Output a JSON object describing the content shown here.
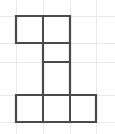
{
  "figure": {
    "type": "grid-polyomino",
    "background_color": "#ffffff",
    "grid": {
      "visible": true,
      "line_color": "#e9e9ea",
      "cell_size": 27,
      "origin_x": 16,
      "origin_y": 16,
      "vertical_lines_x": [
        16,
        43,
        70,
        96
      ],
      "horizontal_lines_y": [
        16,
        43,
        62,
        95,
        122
      ],
      "extra_vertical_lines_x": [],
      "columns": 3,
      "rows": 4
    },
    "shape": {
      "name": "hexomino",
      "cell_count": 6,
      "stroke_color": "#4a4a4a",
      "stroke_width": 2.2,
      "fill_color": "#ffffff",
      "cells": [
        {
          "label": "cell-r0c0",
          "row": 0,
          "col": 0,
          "x": 16,
          "y": 16,
          "w": 27,
          "h": 27
        },
        {
          "label": "cell-r0c1",
          "row": 0,
          "col": 1,
          "x": 43,
          "y": 16,
          "w": 27,
          "h": 27
        },
        {
          "label": "cell-r1c1",
          "row": 1,
          "col": 1,
          "x": 43,
          "y": 43,
          "w": 27,
          "h": 19
        },
        {
          "label": "cell-r2c1",
          "row": 2,
          "col": 1,
          "x": 43,
          "y": 62,
          "w": 27,
          "h": 33
        },
        {
          "label": "cell-r3c0",
          "row": 3,
          "col": 0,
          "x": 16,
          "y": 95,
          "w": 27,
          "h": 27
        },
        {
          "label": "cell-r3c1",
          "row": 3,
          "col": 1,
          "x": 43,
          "y": 95,
          "w": 27,
          "h": 27
        },
        {
          "label": "cell-r3c2",
          "row": 3,
          "col": 2,
          "x": 70,
          "y": 95,
          "w": 26,
          "h": 27
        }
      ],
      "outline_path": "M16,16 L70,16 L70,95 L96,95 L96,122 L16,122 L16,95 L43,95 L43,43 L16,43 Z",
      "internal_dividers": [
        {
          "label": "divider-top-vertical",
          "x1": 43,
          "y1": 16,
          "x2": 43,
          "y2": 43
        },
        {
          "label": "divider-row0-row1",
          "x1": 43,
          "y1": 43,
          "x2": 70,
          "y2": 43
        },
        {
          "label": "divider-row1-row2",
          "x1": 43,
          "y1": 62,
          "x2": 70,
          "y2": 62
        },
        {
          "label": "divider-row2-row3",
          "x1": 43,
          "y1": 95,
          "x2": 70,
          "y2": 95
        },
        {
          "label": "divider-bottom-left",
          "x1": 43,
          "y1": 95,
          "x2": 43,
          "y2": 122
        },
        {
          "label": "divider-bottom-right",
          "x1": 70,
          "y1": 95,
          "x2": 70,
          "y2": 122
        }
      ]
    }
  }
}
